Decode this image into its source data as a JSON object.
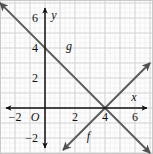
{
  "figure": {
    "kind": "coordinate-graph",
    "width": 153,
    "height": 154,
    "background": "#fdfdfd",
    "border_color": "#c9c9c9"
  },
  "grid": {
    "major_color": "#d2d2d2",
    "minor_color": "#ededed",
    "major_spacing_px": 15,
    "minor_per_major": 3,
    "visible": true
  },
  "axes": {
    "axis_color": "#111111",
    "origin_label": "O",
    "x_axis_label": "x",
    "y_axis_label": "y",
    "origin_px": {
      "x": 45,
      "y": 108
    },
    "unit_px": {
      "x": 15,
      "y": 15
    },
    "x_range": [
      -3,
      7
    ],
    "y_range": [
      -3,
      7
    ],
    "x_ticks": [
      -2,
      2,
      4,
      6
    ],
    "x_tick_labels": [
      "−2",
      "2",
      "4",
      "6"
    ],
    "y_ticks": [
      -2,
      2,
      4,
      6
    ],
    "y_tick_labels": [
      "−2",
      "2",
      "4",
      "6"
    ]
  },
  "chart_data": {
    "type": "line",
    "title": "",
    "xlabel": "x",
    "ylabel": "y",
    "xlim": [
      -3,
      7
    ],
    "ylim": [
      -3,
      7
    ],
    "grid": true,
    "legend": "inline-labels",
    "line_color": "#5b5b5b",
    "series": [
      {
        "name": "g",
        "label": "g",
        "slope": -1,
        "intercept": 4,
        "equation": "y = -x + 4",
        "points": [
          [
            -3,
            7
          ],
          [
            0,
            4
          ],
          [
            2,
            2
          ],
          [
            4,
            0
          ],
          [
            7,
            -3
          ]
        ],
        "x_intercept": 4,
        "y_intercept": 4,
        "label_at": [
          1.6,
          3.9
        ],
        "arrows": "both"
      },
      {
        "name": "f",
        "label": "f",
        "slope": 1,
        "intercept": -4,
        "equation": "y = x - 4",
        "points": [
          [
            1.2,
            -2.8
          ],
          [
            4,
            0
          ],
          [
            7,
            3
          ]
        ],
        "x_intercept": 4,
        "y_intercept": -4,
        "label_at": [
          2.9,
          -2.1
        ],
        "arrows": "both"
      }
    ],
    "intersection": [
      4,
      0
    ]
  }
}
